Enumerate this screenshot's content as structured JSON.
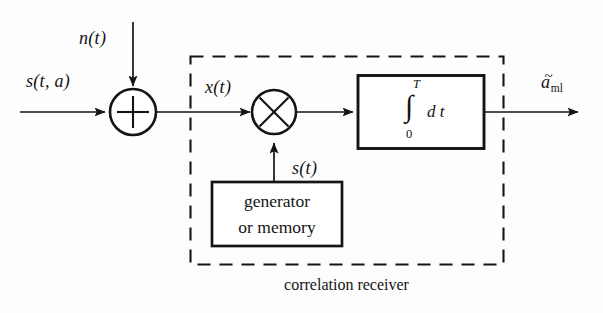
{
  "diagram": {
    "caption": "correlation receiver",
    "colors": {
      "stroke": "#141414",
      "background": "#fdfdfd",
      "text": "#141414"
    },
    "signals": {
      "input_signal": "s(t, a)",
      "noise_input": "n(t)",
      "received_signal": "x(t)",
      "reference_signal": "s(t)",
      "output_estimate_base": "a",
      "output_estimate_sub": "ml",
      "output_estimate": "ãml"
    },
    "blocks": {
      "summer_symbol": "+",
      "multiplier_symbol": "×",
      "integrator": {
        "upper_limit": "T",
        "lower_limit": "0",
        "integral_symbol": "∫",
        "differential": "d t"
      },
      "generator": {
        "line1": "generator",
        "line2": "or memory"
      }
    },
    "dashed_region_label": "correlation receiver"
  }
}
